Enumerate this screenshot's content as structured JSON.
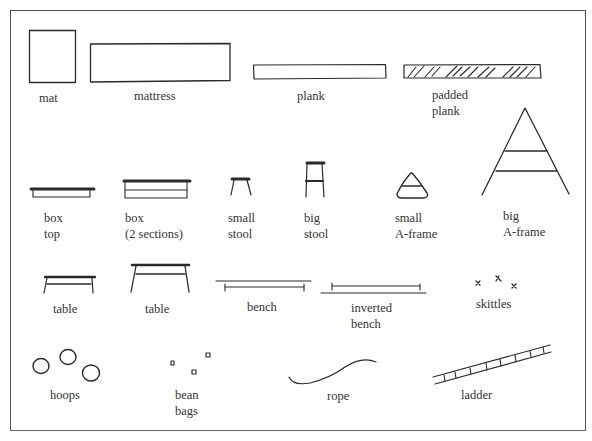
{
  "diagram": {
    "type": "apparatus-legend",
    "items": [
      {
        "id": "mat",
        "lines": [
          "mat"
        ]
      },
      {
        "id": "mattress",
        "lines": [
          "mattress"
        ]
      },
      {
        "id": "plank",
        "lines": [
          "plank"
        ]
      },
      {
        "id": "padded-plank",
        "lines": [
          "padded",
          "plank"
        ]
      },
      {
        "id": "box-top",
        "lines": [
          "box",
          "top"
        ]
      },
      {
        "id": "box-2-sections",
        "lines": [
          "box",
          "(2 sections)"
        ]
      },
      {
        "id": "small-stool",
        "lines": [
          "small",
          "stool"
        ]
      },
      {
        "id": "big-stool",
        "lines": [
          "big",
          "stool"
        ]
      },
      {
        "id": "small-a-frame",
        "lines": [
          "small",
          "A-frame"
        ]
      },
      {
        "id": "big-a-frame",
        "lines": [
          "big",
          "A-frame"
        ]
      },
      {
        "id": "table-small",
        "lines": [
          "table"
        ]
      },
      {
        "id": "table-big",
        "lines": [
          "table"
        ]
      },
      {
        "id": "bench",
        "lines": [
          "bench"
        ]
      },
      {
        "id": "inverted-bench",
        "lines": [
          "inverted",
          "bench"
        ]
      },
      {
        "id": "skittles",
        "lines": [
          "skittles"
        ]
      },
      {
        "id": "hoops",
        "lines": [
          "hoops"
        ]
      },
      {
        "id": "bean-bags",
        "lines": [
          "bean",
          "bags"
        ]
      },
      {
        "id": "rope",
        "lines": [
          "rope"
        ]
      },
      {
        "id": "ladder",
        "lines": [
          "ladder"
        ]
      }
    ],
    "colors": {
      "ink": "#2a2a2a",
      "frame": "#555555",
      "background": "#ffffff"
    }
  }
}
